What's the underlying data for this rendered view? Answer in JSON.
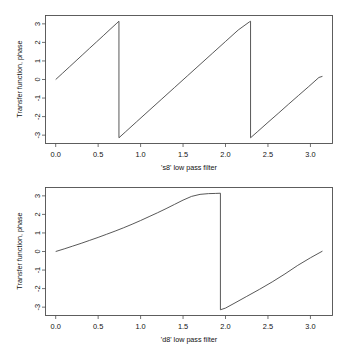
{
  "figure": {
    "background_color": "#ffffff",
    "line_color": "#3a3a3a",
    "axis_color": "#4d4d4d",
    "panel_count": 2
  },
  "chart_data": [
    {
      "type": "line",
      "title": "",
      "xlabel": "'s8'  low pass filter",
      "ylabel": "Transfer function, phase",
      "xlim": [
        -0.12,
        3.26
      ],
      "ylim": [
        -3.45,
        3.45
      ],
      "xticks": [
        0.0,
        0.5,
        1.0,
        1.5,
        2.0,
        2.5,
        3.0
      ],
      "xticklabels": [
        "0.0",
        "0.5",
        "1.0",
        "1.5",
        "2.0",
        "2.5",
        "3.0"
      ],
      "yticks": [
        -3,
        -2,
        -1,
        0,
        1,
        2,
        3
      ],
      "yticklabels": [
        "-3",
        "-2",
        "-1",
        "0",
        "1",
        "2",
        "3"
      ],
      "grid": false,
      "legend": null,
      "series": [
        {
          "name": "phase",
          "x": [
            0.0,
            0.08,
            0.16,
            0.24,
            0.32,
            0.4,
            0.48,
            0.56,
            0.64,
            0.72,
            0.745,
            0.745,
            0.82,
            0.95,
            1.1,
            1.25,
            1.4,
            1.55,
            1.7,
            1.85,
            2.0,
            2.15,
            2.28,
            2.295,
            2.295,
            2.38,
            2.5,
            2.62,
            2.74,
            2.86,
            2.98,
            3.1,
            3.1416
          ],
          "y": [
            0.0,
            0.335,
            0.672,
            1.01,
            1.348,
            1.687,
            2.023,
            2.36,
            2.7,
            3.035,
            3.14,
            -3.1416,
            -2.83,
            -2.29,
            -1.67,
            -1.05,
            -0.43,
            0.19,
            0.81,
            1.43,
            2.05,
            2.67,
            3.1,
            3.1416,
            -3.1416,
            -2.8,
            -2.31,
            -1.83,
            -1.34,
            -0.86,
            -0.38,
            0.11,
            0.17
          ]
        }
      ]
    },
    {
      "type": "line",
      "title": "",
      "xlabel": "'d8'  low pass filter",
      "ylabel": "Transfer function, phase",
      "xlim": [
        -0.12,
        3.26
      ],
      "ylim": [
        -3.45,
        3.45
      ],
      "xticks": [
        0.0,
        0.5,
        1.0,
        1.5,
        2.0,
        2.5,
        3.0
      ],
      "xticklabels": [
        "0.0",
        "0.5",
        "1.0",
        "1.5",
        "2.0",
        "2.5",
        "3.0"
      ],
      "yticks": [
        -3,
        -2,
        -1,
        0,
        1,
        2,
        3
      ],
      "yticklabels": [
        "-3",
        "-2",
        "-1",
        "0",
        "1",
        "2",
        "3"
      ],
      "grid": false,
      "legend": null,
      "series": [
        {
          "name": "phase",
          "x": [
            0.0,
            0.1,
            0.2,
            0.3,
            0.4,
            0.5,
            0.6,
            0.7,
            0.8,
            0.9,
            1.0,
            1.1,
            1.2,
            1.3,
            1.4,
            1.5,
            1.6,
            1.7,
            1.8,
            1.88,
            1.94,
            1.94,
            2.0,
            2.1,
            2.25,
            2.4,
            2.55,
            2.7,
            2.85,
            3.0,
            3.1416
          ],
          "y": [
            0.0,
            0.14,
            0.29,
            0.44,
            0.6,
            0.76,
            0.93,
            1.1,
            1.28,
            1.47,
            1.67,
            1.88,
            2.09,
            2.31,
            2.54,
            2.77,
            2.97,
            3.08,
            3.12,
            3.13,
            3.1416,
            -3.1416,
            -3.05,
            -2.8,
            -2.42,
            -2.04,
            -1.64,
            -1.21,
            -0.75,
            -0.34,
            0.02
          ]
        }
      ]
    }
  ]
}
